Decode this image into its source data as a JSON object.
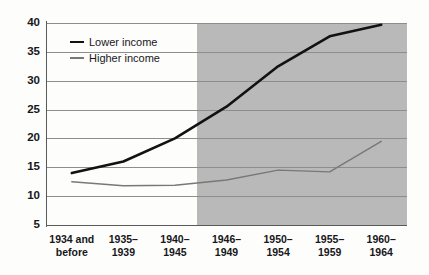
{
  "chart_data": {
    "type": "line",
    "title": "",
    "subtitle": "",
    "xlabel": "",
    "ylabel": "",
    "categories": [
      "1934 and before",
      "1935–1939",
      "1940–1945",
      "1946–1949",
      "1950–1954",
      "1955–1959",
      "1960–1964"
    ],
    "category_lines": [
      [
        "1934 and",
        "before"
      ],
      [
        "1935–",
        "1939"
      ],
      [
        "1940–",
        "1945"
      ],
      [
        "1946–",
        "1949"
      ],
      [
        "1950–",
        "1954"
      ],
      [
        "1955–",
        "1959"
      ],
      [
        "1960–",
        "1964"
      ]
    ],
    "series": [
      {
        "name": "Lower income",
        "color": "#121212",
        "width": 2.6,
        "values": [
          14.0,
          16.0,
          20.0,
          25.5,
          32.5,
          37.7,
          39.7
        ]
      },
      {
        "name": "Higher income",
        "color": "#787878",
        "width": 1.4,
        "values": [
          12.5,
          11.8,
          11.9,
          12.8,
          14.5,
          14.2,
          19.5
        ]
      }
    ],
    "ylim": [
      5,
      40
    ],
    "yticks": [
      5,
      10,
      15,
      20,
      25,
      30,
      35,
      40
    ],
    "ytick_labels": [
      "5",
      "10",
      "15",
      "20",
      "25",
      "30",
      "35",
      "40"
    ],
    "grid": true,
    "legend_position": "inside top-left",
    "legend_entries": [
      "Lower income",
      "Higher income"
    ],
    "shaded_region": {
      "from_category": "1946–1949",
      "to_category": "1960–1964",
      "color": "#b9b9b9"
    },
    "colors": {
      "background": "#fdfdfc",
      "axis": "#5a5a5a",
      "gridline": "#8d8d8d",
      "text": "#17171a",
      "shade": "#b9b9b9"
    }
  }
}
